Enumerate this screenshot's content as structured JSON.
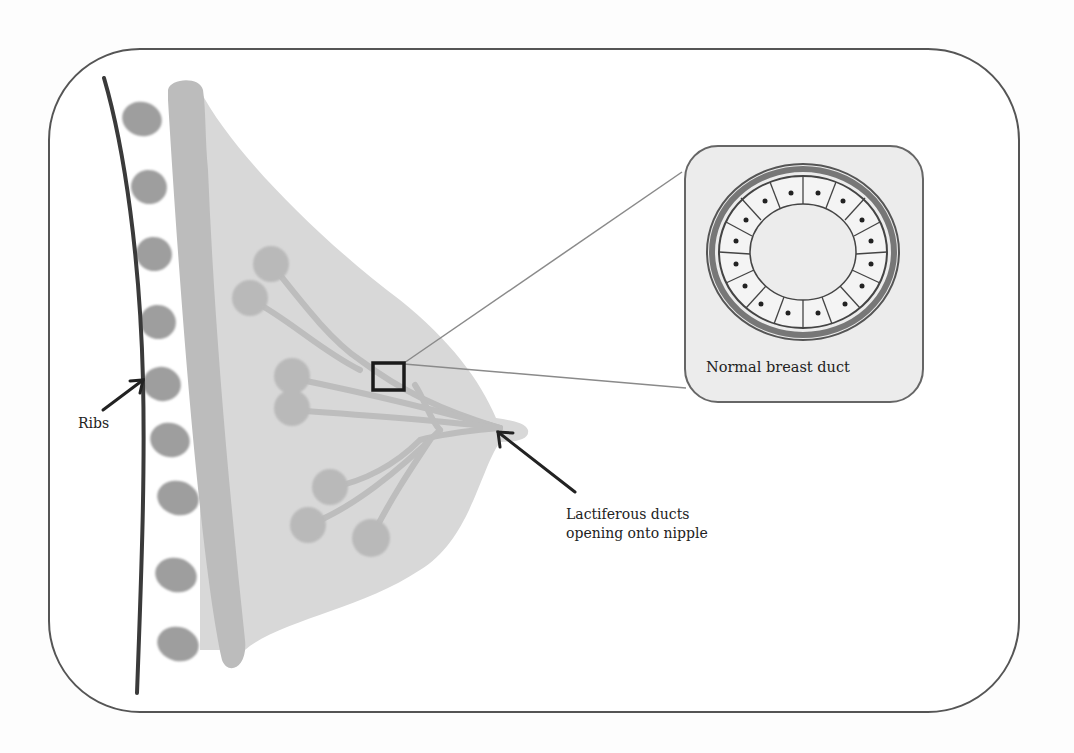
{
  "diagram": {
    "labels": {
      "ribs": "Ribs",
      "ducts_line1": "Lactiferous ducts",
      "ducts_line2": "opening onto nipple",
      "inset": "Normal breast duct"
    },
    "colors": {
      "frame_border": "#555555",
      "breast_tissue": "#d6d6d6",
      "chest_wall": "#bdbdbd",
      "rib": "#9e9e9e",
      "lobule": "#b8b8b8",
      "rib_line": "#3a3a3a",
      "inset_bg": "#ececec",
      "highlight_box": "#1a1a1a"
    },
    "structures": {
      "rib_count": 9,
      "lobule_clusters": 3,
      "duct_cell_count": 22
    }
  }
}
